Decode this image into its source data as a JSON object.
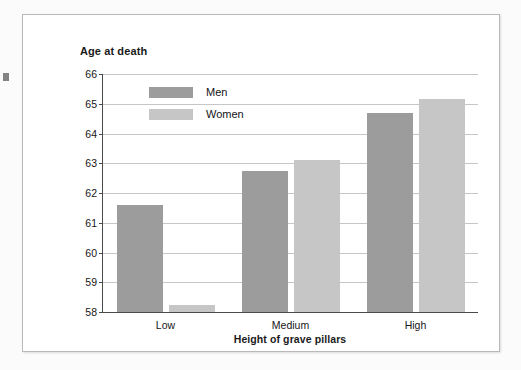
{
  "chart_data": {
    "type": "bar",
    "title": "",
    "xlabel": "Height of grave pillars",
    "ylabel": "Age at death",
    "categories": [
      "Low",
      "Medium",
      "High"
    ],
    "series": [
      {
        "name": "Men",
        "values": [
          61.6,
          62.75,
          64.7
        ],
        "color": "#9c9c9c"
      },
      {
        "name": "Women",
        "values": [
          58.23,
          63.1,
          65.15
        ],
        "color": "#c6c6c6"
      }
    ],
    "ylim": [
      58,
      66
    ],
    "ytick_step": 1,
    "yticks": [
      66,
      65,
      64,
      63,
      62,
      61,
      60,
      59,
      58
    ],
    "ytick_labels": [
      "66",
      "65",
      "64",
      "63",
      "62",
      "61",
      "60",
      "59",
      "58"
    ],
    "grid": true,
    "legend_position": "inside-top-left",
    "legend_entries": [
      "Men",
      "Women"
    ]
  },
  "figure": {
    "y_axis_title": "Age at death",
    "x_axis_title": "Height of grave pillars",
    "background_color": "#ffffff",
    "frame_color": "#b9b9b9",
    "axis_color": "#4a4a4a",
    "gridline_color": "#c6c6c6"
  }
}
